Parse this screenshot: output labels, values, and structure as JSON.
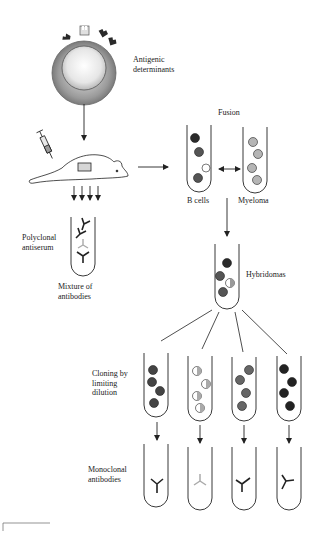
{
  "diagram": {
    "colors": {
      "ink": "#222222",
      "cell_dark": "#333333",
      "cell_mid": "#6a6a6a",
      "cell_light": "#b5b5b5",
      "cell_white": "#ffffff",
      "antibody_grey": "#aaaaaa"
    },
    "labels": {
      "antigenic_determinants": [
        "Antigenic",
        "determinants"
      ],
      "fusion": "Fusion",
      "b_cells": "B cells",
      "myeloma": "Myeloma",
      "polyclonal_antiserum": [
        "Polyclonal",
        "antiserum"
      ],
      "mixture_of_antibodies": [
        "Mixture of",
        "antibodies"
      ],
      "hybridomas": "Hybridomas",
      "cloning_by_limiting_dilution": [
        "Cloning by",
        "limiting",
        "dilution"
      ],
      "monoclonal_antibodies": [
        "Monoclonal",
        "antibodies"
      ]
    },
    "nodes": [
      {
        "id": "antigen-cell",
        "label": "Antigenic determinants"
      },
      {
        "id": "mouse",
        "label": "Immunized mouse"
      },
      {
        "id": "polyclonal-tube",
        "label": "Polyclonal antiserum / Mixture of antibodies"
      },
      {
        "id": "b-cell-tube",
        "label": "B cells"
      },
      {
        "id": "myeloma-tube",
        "label": "Myeloma"
      },
      {
        "id": "hybridoma-tube",
        "label": "Hybridomas"
      },
      {
        "id": "clone-tubes",
        "count": 4,
        "label": "Cloning by limiting dilution"
      },
      {
        "id": "monoclonal-tubes",
        "count": 4,
        "label": "Monoclonal antibodies"
      }
    ],
    "edges": [
      {
        "from": "antigen-cell",
        "to": "mouse"
      },
      {
        "from": "mouse",
        "to": "polyclonal-tube"
      },
      {
        "from": "mouse",
        "to": "b-cell-tube"
      },
      {
        "from": "b-cell-tube",
        "to": "myeloma-tube",
        "label": "Fusion",
        "bidirectional": true
      },
      {
        "from": "b-cell-tube",
        "to": "hybridoma-tube"
      },
      {
        "from": "hybridoma-tube",
        "to": "clone-tubes"
      },
      {
        "from": "clone-tubes",
        "to": "monoclonal-tubes"
      }
    ]
  }
}
